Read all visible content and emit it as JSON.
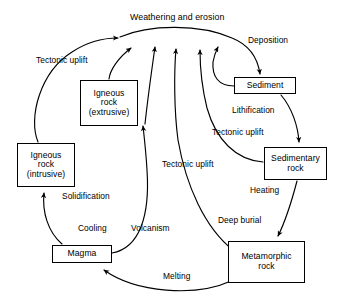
{
  "diagram": {
    "title": "Weathering and erosion",
    "title_pos": {
      "x": 130,
      "y": 12
    },
    "nodes": [
      {
        "id": "igneous-extrusive",
        "lines": [
          "Igneous",
          "rock",
          "(extrusive)"
        ],
        "x": 80,
        "y": 80,
        "w": 58,
        "h": 46
      },
      {
        "id": "igneous-intrusive",
        "lines": [
          "Igneous",
          "rock",
          "(intrusive)"
        ],
        "x": 17,
        "y": 143,
        "w": 58,
        "h": 44
      },
      {
        "id": "sediment",
        "lines": [
          "Sediment"
        ],
        "x": 234,
        "y": 77,
        "w": 62,
        "h": 17
      },
      {
        "id": "sedimentary-rock",
        "lines": [
          "Sedimentary",
          "rock"
        ],
        "x": 264,
        "y": 147,
        "w": 63,
        "h": 33
      },
      {
        "id": "metamorphic-rock",
        "lines": [
          "Metamorphic",
          "rock"
        ],
        "x": 228,
        "y": 241,
        "w": 77,
        "h": 42
      },
      {
        "id": "magma",
        "lines": [
          "Magma"
        ],
        "x": 52,
        "y": 245,
        "w": 60,
        "h": 18
      }
    ],
    "edge_labels": [
      {
        "id": "tectonic-uplift-left",
        "lines": [
          "Tectonic",
          "uplift"
        ],
        "x": 36,
        "y": 55
      },
      {
        "id": "deposition",
        "lines": [
          "Deposition"
        ],
        "x": 248,
        "y": 35
      },
      {
        "id": "lithification",
        "lines": [
          "Lithification"
        ],
        "x": 232,
        "y": 105
      },
      {
        "id": "tectonic-uplift-right",
        "lines": [
          "Tectonic",
          "uplift"
        ],
        "x": 212,
        "y": 127
      },
      {
        "id": "tectonic-uplift-middle",
        "lines": [
          "Tectonic",
          "uplift"
        ],
        "x": 162,
        "y": 159
      },
      {
        "id": "heating",
        "lines": [
          "Heating"
        ],
        "x": 250,
        "y": 185
      },
      {
        "id": "solidification",
        "lines": [
          "Solidification"
        ],
        "x": 62,
        "y": 191
      },
      {
        "id": "deep-burial",
        "lines": [
          "Deep burial"
        ],
        "x": 218,
        "y": 215
      },
      {
        "id": "cooling",
        "lines": [
          "Cooling"
        ],
        "x": 78,
        "y": 223
      },
      {
        "id": "volcanism",
        "lines": [
          "Volcanism"
        ],
        "x": 131,
        "y": 223
      },
      {
        "id": "melting",
        "lines": [
          "Melting"
        ],
        "x": 163,
        "y": 271
      }
    ],
    "edges": [
      {
        "id": "igneous-intrusive-to-weathering",
        "from": "igneous-intrusive",
        "to": "weathering-apex",
        "label": "tectonic-uplift-left"
      },
      {
        "id": "igneous-extrusive-to-weathering",
        "from": "igneous-extrusive",
        "to": "weathering-apex",
        "label": ""
      },
      {
        "id": "magma-to-weathering",
        "from": "magma-region",
        "to": "weathering-apex",
        "label": ""
      },
      {
        "id": "metamorphic-to-weathering",
        "from": "metamorphic-rock",
        "to": "weathering-apex",
        "label": "tectonic-uplift-middle"
      },
      {
        "id": "sedimentary-to-weathering",
        "from": "sedimentary-rock",
        "to": "weathering-apex",
        "label": "tectonic-uplift-right"
      },
      {
        "id": "sediment-to-weathering",
        "from": "sediment",
        "to": "weathering-apex",
        "label": ""
      },
      {
        "id": "weathering-to-sediment",
        "from": "weathering-apex",
        "to": "sediment",
        "label": "deposition"
      },
      {
        "id": "sediment-to-sedimentary",
        "from": "sediment",
        "to": "sedimentary-rock",
        "label": "lithification"
      },
      {
        "id": "sedimentary-to-metamorphic",
        "from": "sedimentary-rock",
        "to": "metamorphic-rock",
        "label": "heating"
      },
      {
        "id": "metamorphic-to-magma",
        "from": "metamorphic-rock",
        "to": "magma",
        "label": "melting"
      },
      {
        "id": "magma-to-igneous-intrusive",
        "from": "magma",
        "to": "igneous-intrusive",
        "label": "solidification"
      },
      {
        "id": "magma-to-igneous-extrusive",
        "from": "magma",
        "to": "igneous-extrusive",
        "label": "volcanism"
      }
    ],
    "colors": {
      "stroke": "#000000",
      "fill": "#ffffff",
      "text": "#000000"
    }
  }
}
